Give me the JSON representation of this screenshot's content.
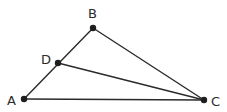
{
  "diagram": {
    "type": "geometry-triangle",
    "points": {
      "A": {
        "label": "A",
        "x": 24,
        "y": 99
      },
      "B": {
        "label": "B",
        "x": 93,
        "y": 28
      },
      "C": {
        "label": "C",
        "x": 204,
        "y": 100
      },
      "D": {
        "label": "D",
        "x": 58,
        "y": 63
      }
    },
    "segments": [
      {
        "from": "A",
        "to": "B"
      },
      {
        "from": "B",
        "to": "C"
      },
      {
        "from": "A",
        "to": "C"
      },
      {
        "from": "D",
        "to": "C"
      }
    ],
    "labels": {
      "A": "A",
      "B": "B",
      "C": "C",
      "D": "D"
    }
  }
}
